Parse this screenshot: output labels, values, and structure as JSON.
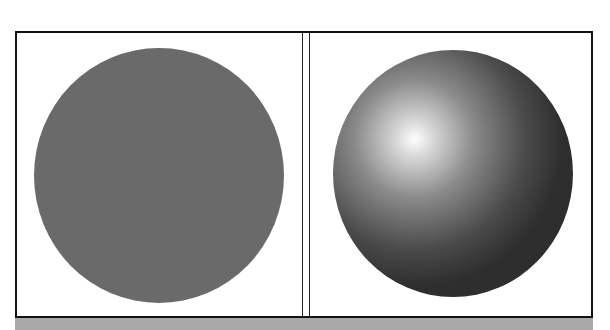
{
  "figure": {
    "panels": [
      {
        "id": "flat",
        "shape": "circle",
        "shading": "flat",
        "fill_color": "#6a6a6a"
      },
      {
        "id": "shaded",
        "shape": "sphere",
        "shading": "radial-gradient",
        "highlight_color": "#ffffff",
        "mid_color": "#8a8a8a",
        "shadow_color": "#2e2e2e",
        "highlight_position": "upper-left"
      }
    ],
    "colors": {
      "frame_border": "#111111",
      "background": "#ffffff",
      "bottom_band": "#a9a9a9"
    }
  }
}
